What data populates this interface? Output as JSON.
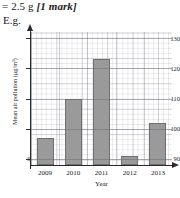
{
  "answer": {
    "result_text": "= 2.5 g ",
    "mark_text": "[1 mark]",
    "example_label": "E.g."
  },
  "chart_data": {
    "type": "bar",
    "title": "",
    "xlabel": "Year",
    "ylabel": "Mean air pollution (µg/m³)",
    "categories": [
      "2009",
      "2010",
      "2011",
      "2012",
      "2013"
    ],
    "values": [
      97,
      110,
      123,
      91,
      102
    ],
    "ylim": [
      88,
      132
    ],
    "yticks": [
      130,
      120,
      110,
      100,
      90
    ],
    "ytick_labels": [
      "130",
      "120",
      "110",
      "100",
      "90"
    ],
    "axis_break_symbol": "≈",
    "grid": true,
    "grid_style": "graph-paper",
    "legend": "none",
    "bar_fill_color": "#9a9a9a",
    "bar_edge_color": "#6f6f6f",
    "axis_color": "#2a2a2a"
  }
}
